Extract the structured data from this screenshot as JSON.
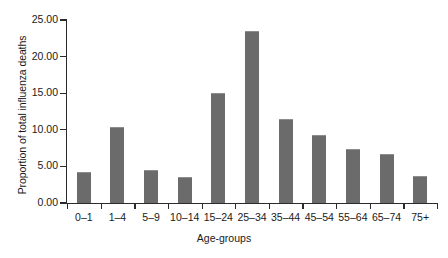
{
  "chart_data": {
    "type": "bar",
    "title": "",
    "subtitle": "",
    "xlabel": "Age-groups",
    "ylabel": "Proportion of total influenza deaths",
    "categories": [
      "0–1",
      "1–4",
      "5–9",
      "10–14",
      "15–24",
      "25–34",
      "35–44",
      "45–54",
      "55–64",
      "65–74",
      "75+"
    ],
    "values": [
      4.1,
      10.3,
      4.4,
      3.4,
      14.9,
      23.4,
      11.3,
      9.2,
      7.3,
      6.5,
      3.6
    ],
    "ylim": [
      0,
      25
    ],
    "ytick_values": [
      0,
      5,
      10,
      15,
      20,
      25
    ],
    "ytick_labels": [
      "0.00",
      "5.00",
      "10.00",
      "15.00",
      "20.00",
      "25.00"
    ],
    "grid": false,
    "legend": false,
    "legend_position": "none",
    "bar_color": "#6b6b6b",
    "axis_color": "#2b2b2b",
    "background_color": "#ffffff"
  }
}
